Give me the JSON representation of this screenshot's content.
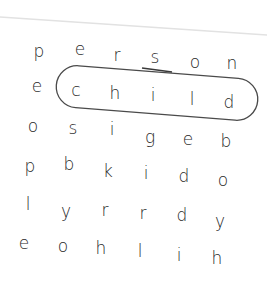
{
  "puzzle": {
    "type": "word-search",
    "grid": [
      [
        "p",
        "e",
        "r",
        "s",
        "o",
        "n"
      ],
      [
        "e",
        "c",
        "h",
        "i",
        "l",
        "d"
      ],
      [
        "o",
        "s",
        "i",
        "g",
        "e",
        "b"
      ],
      [
        "p",
        "b",
        "k",
        "i",
        "d",
        "o"
      ],
      [
        "l",
        "y",
        "r",
        "r",
        "d",
        "y"
      ],
      [
        "e",
        "o",
        "h",
        "l",
        "i",
        "h"
      ]
    ],
    "circled_word": "child",
    "circled_row": 1,
    "circled_cols": [
      1,
      5
    ],
    "colors": {
      "ink": "#2a2a2a",
      "circle": "#444444",
      "paper_edge": "#dddddd",
      "background": "#ffffff"
    }
  }
}
